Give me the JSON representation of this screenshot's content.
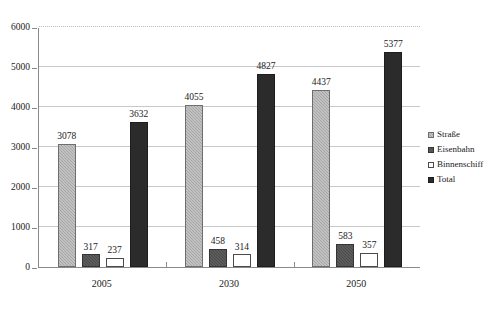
{
  "chart_data": {
    "type": "bar",
    "title": "",
    "subtitle": "",
    "xlabel": "",
    "ylabel": "",
    "categories": [
      "2005",
      "2030",
      "2050"
    ],
    "series": [
      {
        "name": "Straße",
        "values": [
          3078,
          4055,
          4437
        ],
        "color": "#a6a6a6"
      },
      {
        "name": "Eisenbahn",
        "values": [
          317,
          458,
          583
        ],
        "color": "#4a4a4a"
      },
      {
        "name": "Binnenschiff",
        "values": [
          237,
          314,
          357
        ],
        "color": "#ffffff"
      },
      {
        "name": "Total",
        "values": [
          3632,
          4827,
          5377
        ],
        "color": "#2b2b2b"
      }
    ],
    "ylim": [
      0,
      6000
    ],
    "yticks": [
      0,
      1000,
      2000,
      3000,
      4000,
      5000,
      6000
    ],
    "ytick_labels": [
      "0",
      "1000",
      "2000",
      "3000",
      "4000",
      "5000",
      "6000"
    ],
    "grid": true,
    "data_labels": true,
    "legend_position": "right"
  },
  "legend": {
    "items": [
      {
        "label": "Straße"
      },
      {
        "label": "Eisenbahn"
      },
      {
        "label": "Binnenschiff"
      },
      {
        "label": "Total"
      }
    ]
  }
}
